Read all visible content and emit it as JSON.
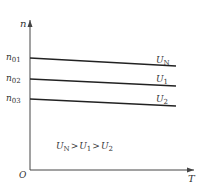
{
  "diagram": {
    "y_axis_label": "n",
    "x_axis_label": "T",
    "origin_label": "O",
    "y_ticks": [
      {
        "main": "n",
        "sub": "01"
      },
      {
        "main": "n",
        "sub": "02"
      },
      {
        "main": "n",
        "sub": "03"
      }
    ],
    "curves": [
      {
        "main": "U",
        "sub": "N"
      },
      {
        "main": "U",
        "sub": "1"
      },
      {
        "main": "U",
        "sub": "2"
      }
    ],
    "relation": {
      "parts": [
        {
          "main": "U",
          "sub": "N"
        },
        {
          "op": ">"
        },
        {
          "main": "U",
          "sub": "1"
        },
        {
          "op": ">"
        },
        {
          "main": "U",
          "sub": "2"
        }
      ]
    }
  }
}
